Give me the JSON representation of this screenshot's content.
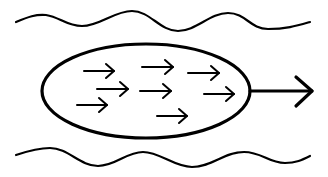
{
  "diagram": {
    "colors": {
      "background": "#ffffff",
      "stroke": "#000000"
    },
    "top_boundary": {
      "path": "M16,22 C28,17 36,14 46,15 C60,17 66,26 82,26 C100,26 114,11 132,11 C150,11 160,31 178,31 C196,31 210,13 228,13 C246,13 250,29 268,29 C286,29 296,26 310,22"
    },
    "bottom_boundary": {
      "path": "M16,155 C28,151 38,148 50,148 C68,148 80,166 98,166 C116,166 126,152 143,152 C160,152 174,167 192,167 C212,167 224,152 244,152 C262,152 268,163 285,163 C296,163 302,160 310,156"
    },
    "ellipse": {
      "cx": 146,
      "cy": 91,
      "rx": 104,
      "ry": 47
    },
    "main_arrow": {
      "x1": 250,
      "y1": 91,
      "x2": 312,
      "y2": 91,
      "head": "M296,77 L312,91 L296,106"
    },
    "particles": [
      {
        "x1": 84,
        "y1": 71,
        "x2": 114,
        "y2": 71
      },
      {
        "x1": 142,
        "y1": 67,
        "x2": 173,
        "y2": 67
      },
      {
        "x1": 188,
        "y1": 73,
        "x2": 219,
        "y2": 73
      },
      {
        "x1": 97,
        "y1": 89,
        "x2": 128,
        "y2": 89
      },
      {
        "x1": 140,
        "y1": 91,
        "x2": 171,
        "y2": 91
      },
      {
        "x1": 204,
        "y1": 94,
        "x2": 234,
        "y2": 94
      },
      {
        "x1": 77,
        "y1": 105,
        "x2": 107,
        "y2": 105
      },
      {
        "x1": 157,
        "y1": 116,
        "x2": 187,
        "y2": 116
      }
    ]
  }
}
